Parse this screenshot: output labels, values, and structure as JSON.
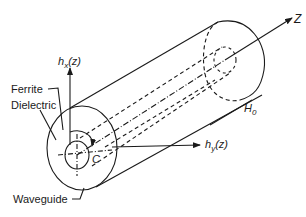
{
  "diagram": {
    "labels": {
      "z_axis": "Z",
      "hx_main": "h",
      "hx_sub": "x",
      "hx_arg": "(z)",
      "hy_main": "h",
      "hy_sub": "y",
      "hy_arg": "(z)",
      "h0_main": "H",
      "h0_sub": "0",
      "ferrite": "Ferrite",
      "dielectric": "Dielectric",
      "waveguide": "Waveguide",
      "center": "C"
    },
    "colors": {
      "line": "#1a1a1a",
      "background": "#ffffff"
    }
  }
}
